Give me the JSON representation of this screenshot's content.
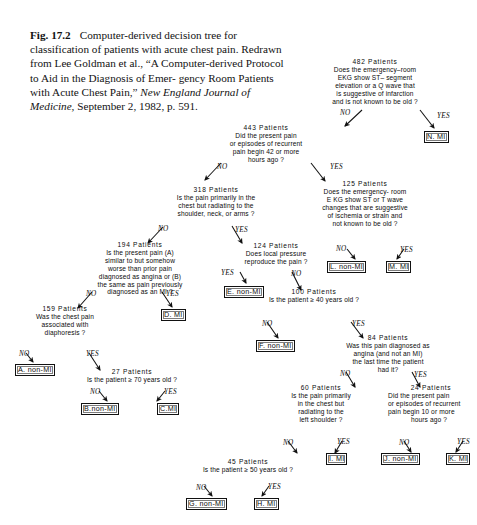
{
  "caption": {
    "fig_no": "Fig. 17.2",
    "line1": "Computer-derived decision tree for classification of patients with",
    "line2": "acute chest pain. Redrawn from Lee Goldman et al., “A Computer-derived",
    "line3": "Protocol to Aid in the Diagnosis of Emer-",
    "line4": "gency Room Patients with Acute Chest",
    "line5_pre": "Pain,” ",
    "line5_ital": "New England Journal of Medicine,",
    "line6": "September 2, 1982, p. 591."
  },
  "edge_labels": {
    "no": "NO",
    "yes": "YES"
  },
  "nodes": [
    {
      "id": "root",
      "count": "482 Patients",
      "q": [
        "Does the emergency–room",
        "EKG show  ST– segment",
        "elevation or a Q wave that",
        "is suggestive of infarction",
        "and is not known to be old ?"
      ]
    },
    {
      "id": "n443",
      "count": "443 Patients",
      "q": [
        "Did the present pain",
        "or episodes of recurrent",
        "pain begin 42 or more",
        "hours ago ?"
      ]
    },
    {
      "id": "n125",
      "count": "125 Patients",
      "q": [
        "Does the emergency- room",
        "E KG show ST or T wave",
        "changes that are suggestive",
        "of ischemia or strain and",
        "not known to be old ?"
      ]
    },
    {
      "id": "n318",
      "count": "318 Patients",
      "q": [
        "Is the pain primarily in the",
        "chest but radiating to the",
        "shoulder, neck, or arms ?"
      ]
    },
    {
      "id": "n124",
      "count": "124 Patients",
      "q": [
        "Does local pressure",
        "reproduce the pain ?"
      ]
    },
    {
      "id": "n194",
      "count": "194 Patients",
      "q": [
        "Is the present pain (A)",
        "similar to but somehow",
        "worse than prior pain",
        "diagnosed as angina or (B)",
        "the same as pain previously",
        "diagnosed as an MI ?"
      ]
    },
    {
      "id": "n100",
      "count": "100 Patients",
      "q": [
        "Is the patient ≥ 40 years old ?"
      ]
    },
    {
      "id": "n159",
      "count": "159 Patients",
      "q": [
        "Was the chest pain",
        "associated with",
        "diaphoresis ?"
      ]
    },
    {
      "id": "n84",
      "count": "84 Patients",
      "q": [
        "Was this pain diagnosed as",
        "angina (and not an MI)",
        "the last time the patient",
        "had it?"
      ]
    },
    {
      "id": "n27",
      "count": "27 Patients",
      "q": [
        "Is the patient ≥ 70 years old ?"
      ]
    },
    {
      "id": "n60",
      "count": "60 Patients",
      "q": [
        "Is the pain primarily",
        "in the chest but",
        "radiating to the",
        "left shoulder ?"
      ]
    },
    {
      "id": "n24",
      "count": "24 Patients",
      "q": [
        "Did the present pain",
        "or episodes of recurrent",
        "pain begin 10 or more",
        "hours ago ?"
      ]
    },
    {
      "id": "n45",
      "count": "45 Patients",
      "q": [
        "Is the patient ≥ 50 years old ?"
      ]
    }
  ],
  "leaves": [
    {
      "id": "N",
      "label": "N. MI"
    },
    {
      "id": "L",
      "label": "L. non-MI"
    },
    {
      "id": "M",
      "label": "M. MI"
    },
    {
      "id": "E",
      "label": "E. non-MI"
    },
    {
      "id": "D",
      "label": "D. MI"
    },
    {
      "id": "F",
      "label": "F. non-MI"
    },
    {
      "id": "A",
      "label": "A. non-MI"
    },
    {
      "id": "B",
      "label": "B.non-MI"
    },
    {
      "id": "C",
      "label": "C.MI"
    },
    {
      "id": "I",
      "label": "I. MI"
    },
    {
      "id": "J",
      "label": "J. non-MI"
    },
    {
      "id": "K",
      "label": "K. MI"
    },
    {
      "id": "G",
      "label": "G. non-MI"
    },
    {
      "id": "H",
      "label": "H. MI"
    }
  ]
}
